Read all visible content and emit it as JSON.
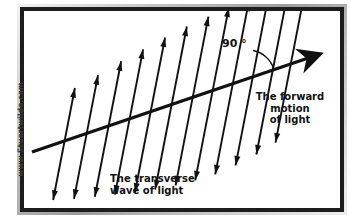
{
  "figure": {
    "type": "physics-diagram",
    "background_color": "#ffffff",
    "stroke_color": "#111111",
    "frame_color": "#9c9c9c",
    "frame_inner_color": "#1d1d1d"
  },
  "watermark": {
    "text": "www.Stuartwilde.com",
    "orientation": "vertical-bottom-to-top",
    "color": "#3a3a3a"
  },
  "labels": {
    "angle": "90 °",
    "forward_motion": "The forward\nmotion\nof light",
    "transverse_wave": "The transverse\nwave of light"
  },
  "diagram_data": {
    "type": "vector-diagram",
    "propagation_axis": {
      "name": "forward-motion-of-light-axis",
      "description": "Thick arrow pointing up-and-right representing direction of light travel",
      "start": [
        8,
        141
      ],
      "end": [
        296,
        43
      ],
      "slope_degrees": -19,
      "arrowhead": "solid-triangle",
      "arrowhead_size_px": 26,
      "line_width_px": 3.2
    },
    "angle_marker": {
      "name": "right-angle-arc",
      "value": 90,
      "unit": "degrees",
      "vertex": [
        224,
        66
      ],
      "radius_px": 27
    },
    "oscillation_arrows": {
      "name": "transverse-oscillation-double-arrows",
      "count": 12,
      "style": "double-headed",
      "tilt_degrees": 11,
      "line_width_px": 1.9,
      "description": "Double-headed arrows perpendicular-ish to the propagation axis showing transverse oscillation",
      "items": [
        {
          "index": 1,
          "cx": 40,
          "cy": 133,
          "half_length": 57
        },
        {
          "index": 2,
          "cx": 62,
          "cy": 126,
          "half_length": 63
        },
        {
          "index": 3,
          "cx": 84,
          "cy": 118,
          "half_length": 69
        },
        {
          "index": 4,
          "cx": 105,
          "cy": 111,
          "half_length": 74
        },
        {
          "index": 5,
          "cx": 126,
          "cy": 104,
          "half_length": 79
        },
        {
          "index": 6,
          "cx": 147,
          "cy": 97,
          "half_length": 83
        },
        {
          "index": 7,
          "cx": 168,
          "cy": 90,
          "half_length": 86
        },
        {
          "index": 8,
          "cx": 188,
          "cy": 83,
          "half_length": 88
        },
        {
          "index": 9,
          "cx": 208,
          "cy": 77,
          "half_length": 88
        },
        {
          "index": 10,
          "cx": 228,
          "cy": 70,
          "half_length": 86
        },
        {
          "index": 11,
          "cx": 248,
          "cy": 63,
          "half_length": 82
        },
        {
          "index": 12,
          "cx": 266,
          "cy": 57,
          "half_length": 76
        }
      ]
    }
  }
}
